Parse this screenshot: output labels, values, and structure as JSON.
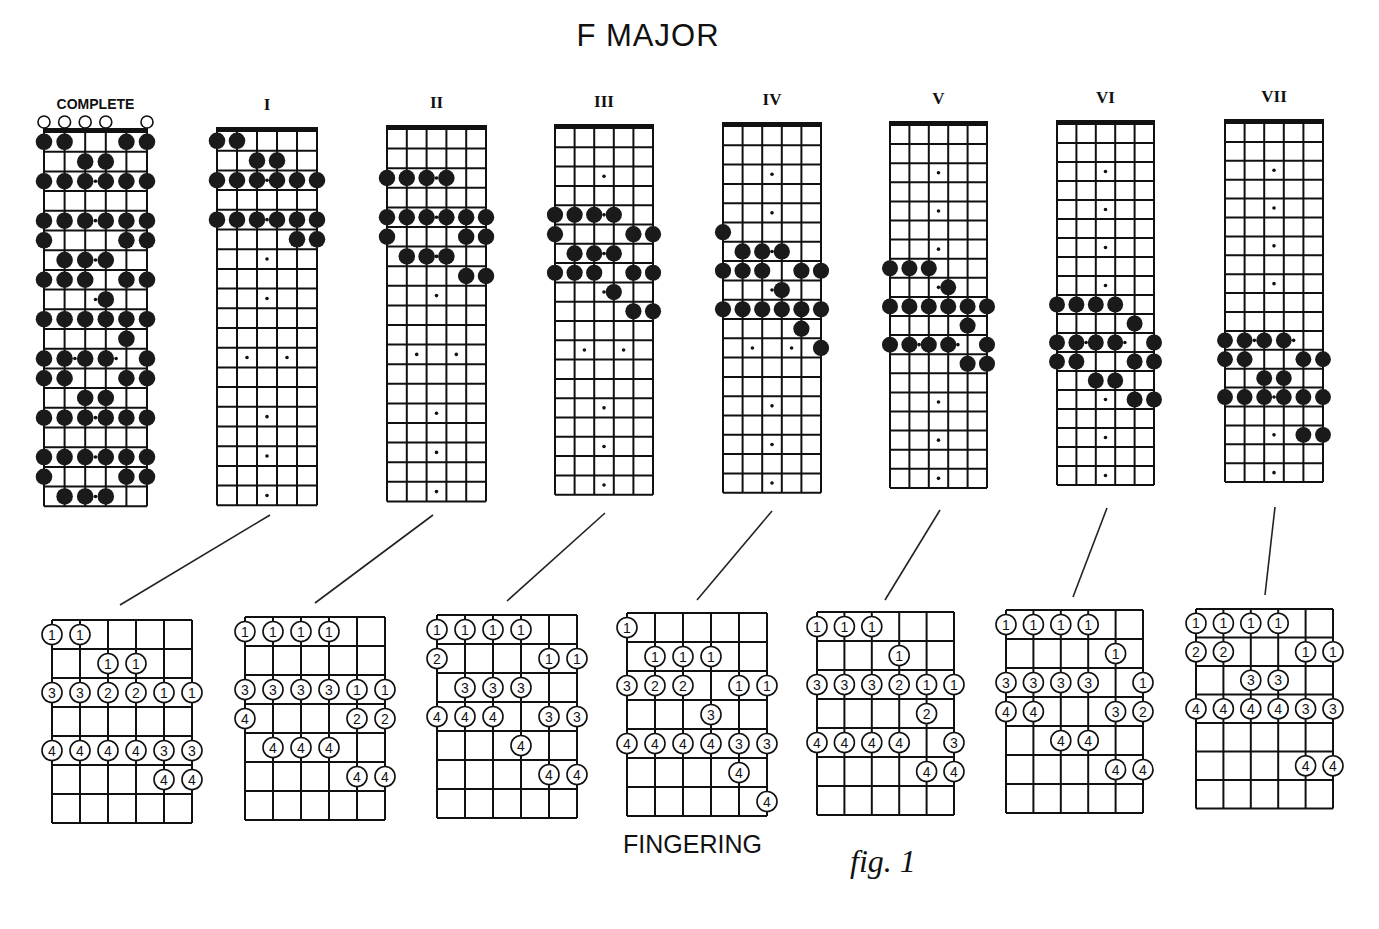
{
  "title": "F MAJOR",
  "footer": {
    "fingering_label": "FINGERING",
    "figure_label": "fig. 1"
  },
  "fretboard": {
    "strings": 6,
    "frets": 19,
    "inlays": [
      3,
      5,
      7,
      9,
      12,
      15,
      17,
      19
    ],
    "double_inlay": 12
  },
  "complete": {
    "label": "COMPLETE",
    "open_strings": [
      0,
      1,
      2,
      3,
      5
    ],
    "notes": [
      [
        1,
        [
          0,
          1,
          4,
          5
        ]
      ],
      [
        2,
        [
          2,
          3
        ]
      ],
      [
        3,
        [
          0,
          1,
          2,
          3,
          4,
          5
        ]
      ],
      [
        5,
        [
          0,
          1,
          2,
          3,
          4,
          5
        ]
      ],
      [
        6,
        [
          0,
          4,
          5
        ]
      ],
      [
        7,
        [
          1,
          2,
          3
        ]
      ],
      [
        8,
        [
          0,
          1,
          2,
          4,
          5
        ]
      ],
      [
        9,
        [
          3
        ]
      ],
      [
        10,
        [
          0,
          1,
          2,
          3,
          4,
          5
        ]
      ],
      [
        11,
        [
          4
        ]
      ],
      [
        12,
        [
          0,
          1,
          2,
          3,
          5
        ]
      ],
      [
        13,
        [
          0,
          1,
          4,
          5
        ]
      ],
      [
        14,
        [
          2,
          3
        ]
      ],
      [
        15,
        [
          0,
          1,
          2,
          3,
          4,
          5
        ]
      ],
      [
        17,
        [
          0,
          1,
          2,
          3,
          4,
          5
        ]
      ],
      [
        18,
        [
          0,
          4,
          5
        ]
      ],
      [
        19,
        [
          1,
          2,
          3
        ]
      ]
    ]
  },
  "positions": [
    {
      "label": "I",
      "notes": [
        [
          1,
          [
            0,
            1
          ]
        ],
        [
          2,
          [
            2,
            3
          ]
        ],
        [
          3,
          [
            0,
            1,
            2,
            3,
            4,
            5
          ]
        ],
        [
          5,
          [
            0,
            1,
            2,
            3,
            4,
            5
          ]
        ],
        [
          6,
          [
            4,
            5
          ]
        ]
      ],
      "fingering": {
        "rows": 7,
        "notes": [
          [
            0,
            0,
            "1"
          ],
          [
            0,
            1,
            "1"
          ],
          [
            1,
            2,
            "1"
          ],
          [
            1,
            3,
            "1"
          ],
          [
            2,
            0,
            "3"
          ],
          [
            2,
            1,
            "3"
          ],
          [
            2,
            2,
            "2"
          ],
          [
            2,
            3,
            "2"
          ],
          [
            2,
            4,
            "1"
          ],
          [
            2,
            5,
            "1"
          ],
          [
            4,
            0,
            "4"
          ],
          [
            4,
            1,
            "4"
          ],
          [
            4,
            2,
            "4"
          ],
          [
            4,
            3,
            "4"
          ],
          [
            4,
            4,
            "3"
          ],
          [
            4,
            5,
            "3"
          ],
          [
            5,
            4,
            "4"
          ],
          [
            5,
            5,
            "4"
          ]
        ]
      }
    },
    {
      "label": "II",
      "notes": [
        [
          3,
          [
            0,
            1,
            2,
            3
          ]
        ],
        [
          5,
          [
            0,
            1,
            2,
            3,
            4,
            5
          ]
        ],
        [
          6,
          [
            0,
            4,
            5
          ]
        ],
        [
          7,
          [
            1,
            2,
            3
          ]
        ],
        [
          8,
          [
            4,
            5
          ]
        ]
      ],
      "fingering": {
        "rows": 7,
        "notes": [
          [
            0,
            0,
            "1"
          ],
          [
            0,
            1,
            "1"
          ],
          [
            0,
            2,
            "1"
          ],
          [
            0,
            3,
            "1"
          ],
          [
            2,
            0,
            "3"
          ],
          [
            2,
            1,
            "3"
          ],
          [
            2,
            2,
            "3"
          ],
          [
            2,
            3,
            "3"
          ],
          [
            2,
            4,
            "1"
          ],
          [
            2,
            5,
            "1"
          ],
          [
            3,
            0,
            "4"
          ],
          [
            3,
            4,
            "2"
          ],
          [
            3,
            5,
            "2"
          ],
          [
            4,
            1,
            "4"
          ],
          [
            4,
            2,
            "4"
          ],
          [
            4,
            3,
            "4"
          ],
          [
            5,
            4,
            "4"
          ],
          [
            5,
            5,
            "4"
          ]
        ]
      }
    },
    {
      "label": "III",
      "notes": [
        [
          5,
          [
            0,
            1,
            2,
            3
          ]
        ],
        [
          6,
          [
            0,
            4,
            5
          ]
        ],
        [
          7,
          [
            1,
            2,
            3
          ]
        ],
        [
          8,
          [
            0,
            1,
            2,
            4,
            5
          ]
        ],
        [
          9,
          [
            3
          ]
        ],
        [
          10,
          [
            4,
            5
          ]
        ]
      ],
      "fingering": {
        "rows": 7,
        "notes": [
          [
            0,
            0,
            "1"
          ],
          [
            0,
            1,
            "1"
          ],
          [
            0,
            2,
            "1"
          ],
          [
            0,
            3,
            "1"
          ],
          [
            1,
            0,
            "2"
          ],
          [
            1,
            4,
            "1"
          ],
          [
            1,
            5,
            "1"
          ],
          [
            2,
            1,
            "3"
          ],
          [
            2,
            2,
            "3"
          ],
          [
            2,
            3,
            "3"
          ],
          [
            3,
            0,
            "4"
          ],
          [
            3,
            1,
            "4"
          ],
          [
            3,
            2,
            "4"
          ],
          [
            3,
            4,
            "3"
          ],
          [
            3,
            5,
            "3"
          ],
          [
            4,
            3,
            "4"
          ],
          [
            5,
            4,
            "4"
          ],
          [
            5,
            5,
            "4"
          ]
        ]
      }
    },
    {
      "label": "IV",
      "notes": [
        [
          6,
          [
            0
          ]
        ],
        [
          7,
          [
            1,
            2,
            3
          ]
        ],
        [
          8,
          [
            0,
            1,
            2,
            4,
            5
          ]
        ],
        [
          9,
          [
            3
          ]
        ],
        [
          10,
          [
            0,
            1,
            2,
            3,
            4,
            5
          ]
        ],
        [
          11,
          [
            4
          ]
        ],
        [
          12,
          [
            5
          ]
        ]
      ],
      "fingering": {
        "rows": 7,
        "notes": [
          [
            0,
            0,
            "1"
          ],
          [
            1,
            1,
            "1"
          ],
          [
            1,
            2,
            "1"
          ],
          [
            1,
            3,
            "1"
          ],
          [
            2,
            0,
            "3"
          ],
          [
            2,
            1,
            "2"
          ],
          [
            2,
            2,
            "2"
          ],
          [
            2,
            4,
            "1"
          ],
          [
            2,
            5,
            "1"
          ],
          [
            3,
            3,
            "3"
          ],
          [
            4,
            0,
            "4"
          ],
          [
            4,
            1,
            "4"
          ],
          [
            4,
            2,
            "4"
          ],
          [
            4,
            3,
            "4"
          ],
          [
            4,
            4,
            "3"
          ],
          [
            4,
            5,
            "3"
          ],
          [
            5,
            4,
            "4"
          ],
          [
            6,
            5,
            "4"
          ]
        ]
      }
    },
    {
      "label": "V",
      "notes": [
        [
          8,
          [
            0,
            1,
            2
          ]
        ],
        [
          9,
          [
            3
          ]
        ],
        [
          10,
          [
            0,
            1,
            2,
            3,
            4,
            5
          ]
        ],
        [
          11,
          [
            4
          ]
        ],
        [
          12,
          [
            0,
            1,
            2,
            3,
            5
          ]
        ],
        [
          13,
          [
            4,
            5
          ]
        ]
      ],
      "fingering": {
        "rows": 7,
        "notes": [
          [
            0,
            0,
            "1"
          ],
          [
            0,
            1,
            "1"
          ],
          [
            0,
            2,
            "1"
          ],
          [
            1,
            3,
            "1"
          ],
          [
            2,
            0,
            "3"
          ],
          [
            2,
            1,
            "3"
          ],
          [
            2,
            2,
            "3"
          ],
          [
            2,
            3,
            "2"
          ],
          [
            2,
            4,
            "1"
          ],
          [
            2,
            5,
            "1"
          ],
          [
            3,
            4,
            "2"
          ],
          [
            4,
            0,
            "4"
          ],
          [
            4,
            1,
            "4"
          ],
          [
            4,
            2,
            "4"
          ],
          [
            4,
            3,
            "4"
          ],
          [
            4,
            5,
            "3"
          ],
          [
            5,
            4,
            "4"
          ],
          [
            5,
            5,
            "4"
          ]
        ]
      }
    },
    {
      "label": "VI",
      "notes": [
        [
          10,
          [
            0,
            1,
            2,
            3
          ]
        ],
        [
          11,
          [
            4
          ]
        ],
        [
          12,
          [
            0,
            1,
            2,
            3,
            5
          ]
        ],
        [
          13,
          [
            0,
            1,
            4,
            5
          ]
        ],
        [
          14,
          [
            2,
            3
          ]
        ],
        [
          15,
          [
            4,
            5
          ]
        ]
      ],
      "fingering": {
        "rows": 7,
        "notes": [
          [
            0,
            0,
            "1"
          ],
          [
            0,
            1,
            "1"
          ],
          [
            0,
            2,
            "1"
          ],
          [
            0,
            3,
            "1"
          ],
          [
            1,
            4,
            "1"
          ],
          [
            2,
            0,
            "3"
          ],
          [
            2,
            1,
            "3"
          ],
          [
            2,
            2,
            "3"
          ],
          [
            2,
            3,
            "3"
          ],
          [
            2,
            5,
            "1"
          ],
          [
            3,
            0,
            "4"
          ],
          [
            3,
            1,
            "4"
          ],
          [
            3,
            4,
            "3"
          ],
          [
            3,
            5,
            "2"
          ],
          [
            4,
            2,
            "4"
          ],
          [
            4,
            3,
            "4"
          ],
          [
            5,
            4,
            "4"
          ],
          [
            5,
            5,
            "4"
          ]
        ]
      }
    },
    {
      "label": "VII",
      "notes": [
        [
          12,
          [
            0,
            1,
            2,
            3
          ]
        ],
        [
          13,
          [
            0,
            1,
            4,
            5
          ]
        ],
        [
          14,
          [
            2,
            3
          ]
        ],
        [
          15,
          [
            0,
            1,
            2,
            3,
            4,
            5
          ]
        ],
        [
          17,
          [
            4,
            5
          ]
        ]
      ],
      "fingering": {
        "rows": 7,
        "notes": [
          [
            0,
            0,
            "1"
          ],
          [
            0,
            1,
            "1"
          ],
          [
            0,
            2,
            "1"
          ],
          [
            0,
            3,
            "1"
          ],
          [
            1,
            0,
            "2"
          ],
          [
            1,
            1,
            "2"
          ],
          [
            1,
            4,
            "1"
          ],
          [
            1,
            5,
            "1"
          ],
          [
            2,
            2,
            "3"
          ],
          [
            2,
            3,
            "3"
          ],
          [
            3,
            0,
            "4"
          ],
          [
            3,
            1,
            "4"
          ],
          [
            3,
            2,
            "4"
          ],
          [
            3,
            3,
            "4"
          ],
          [
            3,
            4,
            "3"
          ],
          [
            3,
            5,
            "3"
          ],
          [
            5,
            4,
            "4"
          ],
          [
            5,
            5,
            "4"
          ]
        ]
      }
    }
  ],
  "layout": {
    "complete": {
      "x": 44,
      "top": 132,
      "w": 103,
      "fh": 19.7
    },
    "boards": [
      {
        "x": 217,
        "top": 131,
        "w": 100,
        "fh": 19.7
      },
      {
        "x": 387,
        "top": 129,
        "w": 99,
        "fh": 19.6
      },
      {
        "x": 555,
        "top": 128,
        "w": 98,
        "fh": 19.3
      },
      {
        "x": 723,
        "top": 126,
        "w": 98,
        "fh": 19.3
      },
      {
        "x": 890,
        "top": 125,
        "w": 97,
        "fh": 19.1
      },
      {
        "x": 1057,
        "top": 124,
        "w": 97,
        "fh": 19.0
      },
      {
        "x": 1225,
        "top": 123,
        "w": 98,
        "fh": 18.9
      }
    ],
    "fing": [
      {
        "x": 52,
        "top": 620,
        "w": 140,
        "rh": 29
      },
      {
        "x": 245,
        "top": 617,
        "w": 140,
        "rh": 29
      },
      {
        "x": 437,
        "top": 615,
        "w": 140,
        "rh": 29
      },
      {
        "x": 627,
        "top": 613,
        "w": 140,
        "rh": 29
      },
      {
        "x": 817,
        "top": 612,
        "w": 137,
        "rh": 29
      },
      {
        "x": 1006,
        "top": 610,
        "w": 137,
        "rh": 29
      },
      {
        "x": 1196,
        "top": 609,
        "w": 137,
        "rh": 28.5
      }
    ],
    "connectors": [
      [
        270,
        515,
        120,
        605
      ],
      [
        433,
        515,
        315,
        603
      ],
      [
        605,
        513,
        507,
        601
      ],
      [
        772,
        511,
        697,
        600
      ],
      [
        940,
        510,
        885,
        600
      ],
      [
        1107,
        508,
        1073,
        597
      ],
      [
        1275,
        507,
        1265,
        595
      ]
    ]
  }
}
